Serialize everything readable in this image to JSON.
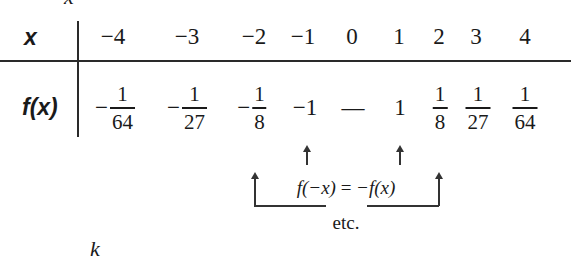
{
  "clipped_top_text": "x",
  "clipped_bottom_text": "k",
  "table": {
    "row_header_x": "x",
    "row_header_fx": "f(x)",
    "x_values": [
      "−4",
      "−3",
      "−2",
      "−1",
      "0",
      "1",
      "2",
      "3",
      "4"
    ],
    "fx_values": [
      {
        "sign": "−",
        "num": "1",
        "den": "64"
      },
      {
        "sign": "−",
        "num": "1",
        "den": "27"
      },
      {
        "sign": "−",
        "num": "1",
        "den": "8"
      },
      {
        "plain": "−1"
      },
      {
        "plain": "—"
      },
      {
        "plain": "1"
      },
      {
        "sign": "",
        "num": "1",
        "den": "8"
      },
      {
        "sign": "",
        "num": "1",
        "den": "27"
      },
      {
        "sign": "",
        "num": "1",
        "den": "64"
      }
    ]
  },
  "annotation": {
    "equation_lhs": "f(−x)",
    "equation_op": "=",
    "equation_rhs": "−f(x)",
    "note": "etc."
  }
}
